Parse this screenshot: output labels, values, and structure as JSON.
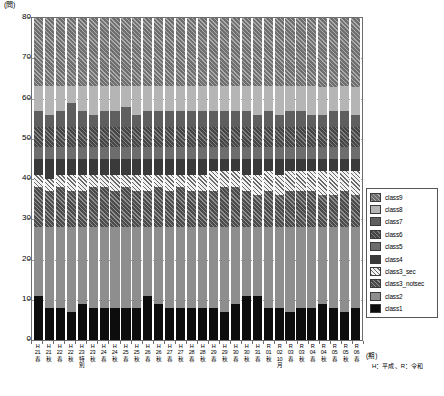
{
  "chart_data": {
    "type": "bar",
    "subtype": "stacked-bar",
    "title": "",
    "xlabel": "(期)",
    "ylabel": "(問)",
    "ylim": [
      0,
      80
    ],
    "yticks": [
      0,
      10,
      20,
      30,
      40,
      50,
      60,
      70,
      80
    ],
    "grid": "horizontal-dotted",
    "legend_position": "right",
    "categories": [
      "H\n21\n春",
      "H\n21\n秋",
      "H\n22\n春",
      "H\n22\n秋",
      "H\n23\n特\n別",
      "H\n23\n秋",
      "H\n24\n春",
      "H\n24\n秋",
      "H\n25\n春",
      "H\n25\n秋",
      "H\n26\n春",
      "H\n26\n秋",
      "H\n27\n春",
      "H\n27\n秋",
      "H\n28\n春",
      "H\n28\n秋",
      "H\n29\n春",
      "H\n29\n秋",
      "H\n30\n春",
      "H\n30\n秋",
      "H\n31\n春",
      "R\n01\n秋",
      "R\n02\n10月",
      "R\n03\n春",
      "R\n03\n秋",
      "R\n04\n春",
      "R\n04\n秋",
      "R\n05\n春",
      "R\n05\n秋",
      "R\n06\n春"
    ],
    "series": [
      {
        "name": "class1",
        "fill": "f-class1",
        "color": "#0d0d0d",
        "values": [
          11,
          8,
          8,
          7,
          9,
          8,
          8,
          8,
          8,
          8,
          11,
          9,
          8,
          8,
          8,
          8,
          8,
          7,
          9,
          11,
          11,
          8,
          8,
          7,
          8,
          8,
          9,
          8,
          7,
          8
        ]
      },
      {
        "name": "class2",
        "fill": "f-class2",
        "color": "#8e8e8e",
        "values": [
          17,
          20,
          20,
          21,
          19,
          20,
          20,
          20,
          20,
          20,
          17,
          19,
          20,
          20,
          20,
          20,
          20,
          21,
          19,
          17,
          17,
          20,
          20,
          21,
          20,
          20,
          19,
          20,
          21,
          20
        ]
      },
      {
        "name": "class3_notsec",
        "fill": "f-class3notsec",
        "color": "#4c4c4c",
        "values": [
          10,
          9,
          10,
          9,
          9,
          10,
          10,
          9,
          10,
          9,
          9,
          10,
          9,
          10,
          9,
          9,
          9,
          10,
          10,
          9,
          8,
          9,
          8,
          9,
          9,
          9,
          8,
          8,
          9,
          8
        ]
      },
      {
        "name": "class3_sec",
        "fill": "f-class3sec",
        "color": "#f2f2f2",
        "values": [
          3,
          3,
          3,
          4,
          4,
          3,
          3,
          4,
          3,
          4,
          4,
          3,
          4,
          3,
          4,
          4,
          5,
          4,
          4,
          4,
          5,
          5,
          5,
          5,
          5,
          5,
          6,
          6,
          5,
          6
        ]
      },
      {
        "name": "class4",
        "fill": "f-class4",
        "color": "#3a3a3a",
        "values": [
          4,
          5,
          4,
          4,
          4,
          4,
          4,
          4,
          4,
          4,
          4,
          4,
          4,
          4,
          4,
          4,
          3,
          3,
          3,
          4,
          4,
          3,
          4,
          3,
          3,
          3,
          3,
          3,
          3,
          3
        ]
      },
      {
        "name": "class5",
        "fill": "f-class5",
        "color": "#6d6d6d",
        "values": [
          3,
          3,
          3,
          3,
          3,
          3,
          3,
          3,
          3,
          3,
          3,
          3,
          3,
          3,
          3,
          3,
          3,
          3,
          3,
          3,
          3,
          3,
          3,
          3,
          3,
          3,
          3,
          3,
          3,
          3
        ]
      },
      {
        "name": "class6",
        "fill": "f-class6",
        "color": "#474747",
        "values": [
          5,
          5,
          5,
          5,
          5,
          5,
          5,
          5,
          5,
          5,
          5,
          5,
          5,
          5,
          5,
          5,
          5,
          5,
          5,
          5,
          5,
          5,
          5,
          5,
          5,
          5,
          5,
          5,
          5,
          5
        ]
      },
      {
        "name": "class7",
        "fill": "f-class7",
        "color": "#5f5f5f",
        "values": [
          4,
          3,
          4,
          6,
          4,
          3,
          4,
          4,
          5,
          3,
          4,
          4,
          4,
          4,
          4,
          4,
          4,
          4,
          4,
          4,
          3,
          4,
          3,
          4,
          4,
          3,
          3,
          4,
          4,
          3
        ]
      },
      {
        "name": "class8",
        "fill": "f-class8",
        "color": "#b5b5b5",
        "values": [
          6,
          7,
          6,
          4,
          6,
          7,
          6,
          6,
          5,
          7,
          6,
          6,
          6,
          6,
          6,
          6,
          6,
          6,
          6,
          6,
          7,
          6,
          7,
          6,
          6,
          7,
          7,
          6,
          6,
          7
        ]
      },
      {
        "name": "class9",
        "fill": "f-class9",
        "color": "#6f6f6f",
        "values": [
          17,
          17,
          17,
          17,
          17,
          17,
          17,
          17,
          17,
          17,
          17,
          17,
          17,
          17,
          17,
          17,
          17,
          17,
          17,
          17,
          17,
          17,
          17,
          17,
          17,
          17,
          17,
          17,
          17,
          17
        ]
      }
    ]
  },
  "legend": {
    "items": [
      {
        "label": "class9",
        "fill": "f-class9"
      },
      {
        "label": "class8",
        "fill": "f-class8"
      },
      {
        "label": "class7",
        "fill": "f-class7"
      },
      {
        "label": "class6",
        "fill": "f-class6"
      },
      {
        "label": "class5",
        "fill": "f-class5"
      },
      {
        "label": "class4",
        "fill": "f-class4"
      },
      {
        "label": "class3_sec",
        "fill": "f-class3sec"
      },
      {
        "label": "class3_notsec",
        "fill": "f-class3notsec"
      },
      {
        "label": "class2",
        "fill": "f-class2"
      },
      {
        "label": "class1",
        "fill": "f-class1"
      }
    ]
  },
  "axis_caption": {
    "x_unit": "(期)",
    "era_note": "H：平成 、R：令和"
  },
  "y_unit": "(問)"
}
